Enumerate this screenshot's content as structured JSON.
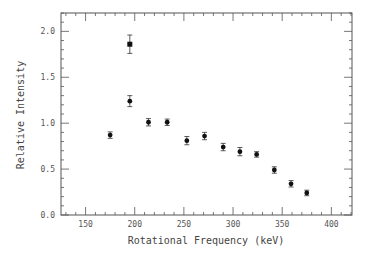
{
  "chart_data": {
    "type": "scatter",
    "title": "",
    "xlabel": "Rotational Frequency (keV)",
    "ylabel": "Relative Intensity",
    "xlim": [
      125,
      421
    ],
    "ylim": [
      0.0,
      2.2
    ],
    "grid": false,
    "legend": null,
    "x_ticks": [
      150,
      200,
      250,
      300,
      350,
      400
    ],
    "x_tick_labels": [
      "150",
      "200",
      "250",
      "300",
      "350",
      "400"
    ],
    "y_ticks": [
      0.0,
      0.5,
      1.0,
      1.5,
      2.0
    ],
    "y_tick_labels": [
      "0.0",
      "0.5",
      "1.0",
      "1.5",
      "2.0"
    ],
    "series": [
      {
        "name": "circles",
        "marker": "circle",
        "x": [
          175,
          195,
          214,
          233,
          253,
          271,
          290,
          307,
          324,
          342,
          359,
          375
        ],
        "y": [
          0.87,
          1.24,
          1.01,
          1.01,
          0.81,
          0.86,
          0.74,
          0.69,
          0.66,
          0.49,
          0.34,
          0.24
        ],
        "yerr": [
          0.035,
          0.06,
          0.04,
          0.035,
          0.045,
          0.04,
          0.04,
          0.045,
          0.03,
          0.035,
          0.035,
          0.03
        ]
      },
      {
        "name": "square",
        "marker": "square",
        "x": [
          195
        ],
        "y": [
          1.86
        ],
        "yerr": [
          0.1
        ]
      }
    ]
  }
}
